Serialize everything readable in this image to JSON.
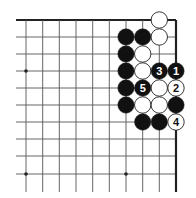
{
  "diagram": {
    "type": "go-board-corner",
    "grid": {
      "cols_x": [
        26,
        42.7,
        59.3,
        76,
        92.7,
        109.3,
        126,
        142.7,
        159.3,
        176
      ],
      "rows_y": [
        20,
        37,
        54,
        71,
        88,
        105,
        122,
        139,
        156,
        174
      ],
      "left_extent": 16,
      "bottom_extent": 192,
      "top_edge": true,
      "right_edge": true
    },
    "star_points": [
      {
        "col": 0,
        "row": 3
      },
      {
        "col": 0,
        "row": 9
      },
      {
        "col": 6,
        "row": 9
      }
    ],
    "stones": [
      {
        "col": 8,
        "row": 0,
        "color": "white",
        "label": ""
      },
      {
        "col": 6,
        "row": 1,
        "color": "black",
        "label": ""
      },
      {
        "col": 7,
        "row": 1,
        "color": "black",
        "label": ""
      },
      {
        "col": 8,
        "row": 1,
        "color": "white",
        "label": ""
      },
      {
        "col": 6,
        "row": 2,
        "color": "black",
        "label": ""
      },
      {
        "col": 7,
        "row": 2,
        "color": "white",
        "label": ""
      },
      {
        "col": 6,
        "row": 3,
        "color": "black",
        "label": ""
      },
      {
        "col": 7,
        "row": 3,
        "color": "white",
        "label": ""
      },
      {
        "col": 8,
        "row": 3,
        "color": "black",
        "label": "3"
      },
      {
        "col": 9,
        "row": 3,
        "color": "black",
        "label": "1"
      },
      {
        "col": 6,
        "row": 4,
        "color": "black",
        "label": ""
      },
      {
        "col": 7,
        "row": 4,
        "color": "black",
        "label": "5"
      },
      {
        "col": 8,
        "row": 4,
        "color": "white",
        "label": ""
      },
      {
        "col": 9,
        "row": 4,
        "color": "white",
        "label": "2"
      },
      {
        "col": 6,
        "row": 5,
        "color": "black",
        "label": ""
      },
      {
        "col": 7,
        "row": 5,
        "color": "white",
        "label": ""
      },
      {
        "col": 8,
        "row": 5,
        "color": "white",
        "label": ""
      },
      {
        "col": 9,
        "row": 5,
        "color": "black",
        "label": ""
      },
      {
        "col": 7,
        "row": 6,
        "color": "black",
        "label": ""
      },
      {
        "col": 8,
        "row": 6,
        "color": "black",
        "label": ""
      },
      {
        "col": 9,
        "row": 6,
        "color": "white",
        "label": "4"
      }
    ],
    "colors": {
      "line": "#555555",
      "edge": "#222222",
      "black_stone": "#111111",
      "white_stone": "#ffffff",
      "stone_outline": "#222222"
    }
  }
}
